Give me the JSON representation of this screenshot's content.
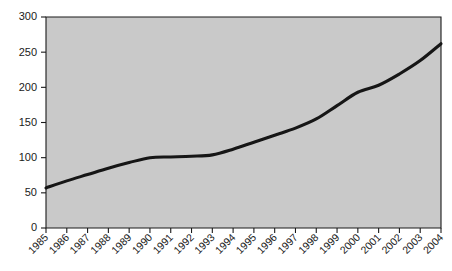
{
  "chart_data": {
    "type": "line",
    "title": "",
    "subtitle": "",
    "xlabel": "",
    "ylabel": "",
    "grid": false,
    "legend": null,
    "legend_position": "none",
    "plot_background_color": "#c9c9c9",
    "line_color": "#161616",
    "axis_color": "#1a1a1a",
    "xlim": [
      1985,
      2004
    ],
    "ylim": [
      0,
      300
    ],
    "ytick_values": [
      0,
      50,
      100,
      150,
      200,
      250,
      300
    ],
    "ytick_labels": [
      "0",
      "50",
      "100",
      "150",
      "200",
      "250",
      "300"
    ],
    "categories": [
      "1985",
      "1986",
      "1987",
      "1988",
      "1989",
      "1990",
      "1991",
      "1992",
      "1993",
      "1994",
      "1995",
      "1996",
      "1997",
      "1998",
      "1999",
      "2000",
      "2001",
      "2002",
      "2003",
      "2004"
    ],
    "x": [
      1985,
      1986,
      1987,
      1988,
      1989,
      1990,
      1991,
      1992,
      1993,
      1994,
      1995,
      1996,
      1997,
      1998,
      1999,
      2000,
      2001,
      2002,
      2003,
      2004
    ],
    "values": [
      57,
      67,
      76,
      85,
      93,
      100,
      101,
      102,
      104,
      112,
      122,
      132,
      142,
      155,
      174,
      193,
      203,
      219,
      238,
      262
    ]
  }
}
